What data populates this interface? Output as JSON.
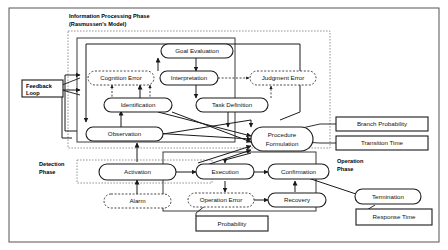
{
  "diagram": {
    "phases": [
      {
        "id": "information-processing",
        "label_line1": "Information Processing Phase",
        "label_line2": "(Rasmussen's Model)"
      },
      {
        "id": "detection",
        "label_line1": "Detection",
        "label_line2": "Phase"
      },
      {
        "id": "operation",
        "label_line1": "Operation",
        "label_line2": "Phase"
      }
    ],
    "nodes": [
      {
        "id": "goal-evaluation",
        "label": "Goal Evaluation",
        "style": "solid"
      },
      {
        "id": "cognition-error",
        "label": "Cognition Error",
        "style": "dashed"
      },
      {
        "id": "interpretation",
        "label": "Interpretation",
        "style": "solid"
      },
      {
        "id": "judgment-error",
        "label": "Judgment Error",
        "style": "dashed"
      },
      {
        "id": "identification",
        "label": "Identification",
        "style": "solid"
      },
      {
        "id": "task-definition",
        "label": "Task Definition",
        "style": "solid"
      },
      {
        "id": "observation",
        "label": "Observation",
        "style": "solid"
      },
      {
        "id": "procedure-formulation",
        "label_line1": "Procedure",
        "label_line2": "Formulation",
        "style": "solid"
      },
      {
        "id": "activation",
        "label": "Activation",
        "style": "solid"
      },
      {
        "id": "execution",
        "label": "Execution",
        "style": "solid"
      },
      {
        "id": "confirmation",
        "label": "Confirmation",
        "style": "solid"
      },
      {
        "id": "alarm",
        "label": "Alarm",
        "style": "dashed"
      },
      {
        "id": "operation-error",
        "label": "Operation Error",
        "style": "dashed"
      },
      {
        "id": "recovery",
        "label": "Recovery",
        "style": "solid"
      },
      {
        "id": "termination",
        "label": "Termination",
        "style": "solid"
      }
    ],
    "annotation_boxes": [
      {
        "id": "feedback-loop",
        "label_line1": "Feedback",
        "label_line2": "Loop"
      },
      {
        "id": "branch-probability",
        "label": "Branch Probability"
      },
      {
        "id": "transition-time",
        "label": "Transition Time"
      },
      {
        "id": "probability",
        "label": "Probability"
      },
      {
        "id": "response-time",
        "label": "Response Time"
      }
    ],
    "colors": {
      "background": "#ffffff",
      "stroke": "#1a1a1a",
      "region_stroke": "#6b6b6b",
      "frame_stroke": "#555555"
    }
  }
}
